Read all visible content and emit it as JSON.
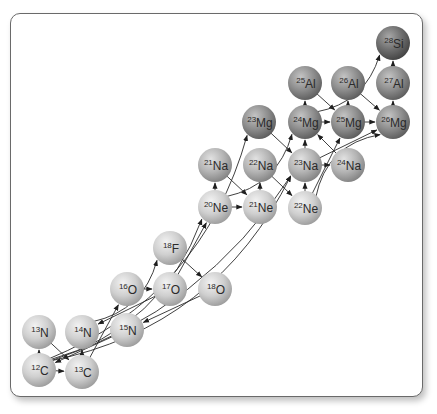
{
  "diagram": {
    "type": "nuclear-reaction-network",
    "node_radius": 17,
    "colors": {
      "light_node": "#c8c8c8",
      "dark_node": "#8a8a8a",
      "edge": "#2a2a2a",
      "frame": "#6a6a6a"
    },
    "nodes": [
      {
        "id": "28Si",
        "mass": "28",
        "el": "Si",
        "x": 393,
        "y": 43,
        "shade": "darkest"
      },
      {
        "id": "25Al",
        "mass": "25",
        "el": "Al",
        "x": 305,
        "y": 83,
        "shade": "dark"
      },
      {
        "id": "26Al",
        "mass": "26",
        "el": "Al",
        "x": 348,
        "y": 83,
        "shade": "dark"
      },
      {
        "id": "27Al",
        "mass": "27",
        "el": "Al",
        "x": 393,
        "y": 83,
        "shade": "dark"
      },
      {
        "id": "23Mg",
        "mass": "23",
        "el": "Mg",
        "x": 259,
        "y": 122,
        "shade": "dark"
      },
      {
        "id": "24Mg",
        "mass": "24",
        "el": "Mg",
        "x": 305,
        "y": 122,
        "shade": "dark"
      },
      {
        "id": "25Mg",
        "mass": "25",
        "el": "Mg",
        "x": 348,
        "y": 122,
        "shade": "dark"
      },
      {
        "id": "26Mg",
        "mass": "26",
        "el": "Mg",
        "x": 393,
        "y": 122,
        "shade": "dark"
      },
      {
        "id": "21Na",
        "mass": "21",
        "el": "Na",
        "x": 215,
        "y": 165,
        "shade": "mid"
      },
      {
        "id": "22Na",
        "mass": "22",
        "el": "Na",
        "x": 260,
        "y": 165,
        "shade": "mid"
      },
      {
        "id": "23Na",
        "mass": "23",
        "el": "Na",
        "x": 305,
        "y": 165,
        "shade": "mid"
      },
      {
        "id": "24Na",
        "mass": "24",
        "el": "Na",
        "x": 348,
        "y": 165,
        "shade": "mid"
      },
      {
        "id": "20Ne",
        "mass": "20",
        "el": "Ne",
        "x": 215,
        "y": 207,
        "shade": "light"
      },
      {
        "id": "21Ne",
        "mass": "21",
        "el": "Ne",
        "x": 260,
        "y": 207,
        "shade": "light"
      },
      {
        "id": "22Ne",
        "mass": "22",
        "el": "Ne",
        "x": 305,
        "y": 208,
        "shade": "light"
      },
      {
        "id": "18F",
        "mass": "18",
        "el": "F",
        "x": 170,
        "y": 248,
        "shade": "light"
      },
      {
        "id": "16O",
        "mass": "16",
        "el": "O",
        "x": 127,
        "y": 289,
        "shade": "light"
      },
      {
        "id": "17O",
        "mass": "17",
        "el": "O",
        "x": 170,
        "y": 289,
        "shade": "light"
      },
      {
        "id": "18O",
        "mass": "18",
        "el": "O",
        "x": 215,
        "y": 289,
        "shade": "light"
      },
      {
        "id": "13N",
        "mass": "13",
        "el": "N",
        "x": 39,
        "y": 332,
        "shade": "light"
      },
      {
        "id": "14N",
        "mass": "14",
        "el": "N",
        "x": 82,
        "y": 332,
        "shade": "light"
      },
      {
        "id": "15N",
        "mass": "15",
        "el": "N",
        "x": 127,
        "y": 330,
        "shade": "light"
      },
      {
        "id": "12C",
        "mass": "12",
        "el": "C",
        "x": 39,
        "y": 370,
        "shade": "light"
      },
      {
        "id": "13C",
        "mass": "13",
        "el": "C",
        "x": 82,
        "y": 372,
        "shade": "light"
      }
    ],
    "edges": [
      {
        "from": "12C",
        "to": "13N"
      },
      {
        "from": "12C",
        "to": "13C"
      },
      {
        "from": "13N",
        "to": "13C"
      },
      {
        "from": "13C",
        "to": "14N",
        "curve": false,
        "via": "16O-line"
      },
      {
        "from": "15N",
        "to": "12C"
      },
      {
        "from": "17O",
        "to": "14N"
      },
      {
        "from": "18O",
        "to": "15N"
      },
      {
        "from": "13C",
        "to": "16O"
      },
      {
        "from": "16O",
        "to": "17O"
      },
      {
        "from": "14N",
        "to": "18F",
        "curve": true
      },
      {
        "from": "18F",
        "to": "18O"
      },
      {
        "from": "17O",
        "to": "20Ne"
      },
      {
        "from": "12C",
        "to": "20Ne",
        "curve": true
      },
      {
        "from": "12C",
        "to": "23Na",
        "curve": true
      },
      {
        "from": "12C",
        "to": "23Na",
        "curve": true,
        "alt": true
      },
      {
        "from": "12C",
        "to": "23Mg",
        "curve": true
      },
      {
        "from": "20Ne",
        "to": "21Na"
      },
      {
        "from": "20Ne",
        "to": "21Ne"
      },
      {
        "from": "21Na",
        "to": "21Ne"
      },
      {
        "from": "21Ne",
        "to": "22Na"
      },
      {
        "from": "22Na",
        "to": "22Ne"
      },
      {
        "from": "20Ne",
        "to": "24Mg",
        "curve": true
      },
      {
        "from": "22Ne",
        "to": "23Na"
      },
      {
        "from": "22Ne",
        "to": "25Mg"
      },
      {
        "from": "22Ne",
        "to": "26Mg",
        "curve": true
      },
      {
        "from": "23Mg",
        "to": "23Na"
      },
      {
        "from": "23Na",
        "to": "24Mg"
      },
      {
        "from": "23Na",
        "to": "24Na"
      },
      {
        "from": "23Na",
        "to": "26Mg"
      },
      {
        "from": "24Na",
        "to": "24Mg"
      },
      {
        "from": "24Mg",
        "to": "25Al"
      },
      {
        "from": "24Mg",
        "to": "25Mg"
      },
      {
        "from": "25Al",
        "to": "25Mg"
      },
      {
        "from": "25Mg",
        "to": "26Al"
      },
      {
        "from": "25Mg",
        "to": "26Mg"
      },
      {
        "from": "26Al",
        "to": "26Mg"
      },
      {
        "from": "26Mg",
        "to": "27Al"
      },
      {
        "from": "27Al",
        "to": "28Si"
      },
      {
        "from": "24Mg",
        "to": "28Si",
        "curve": true
      }
    ]
  }
}
